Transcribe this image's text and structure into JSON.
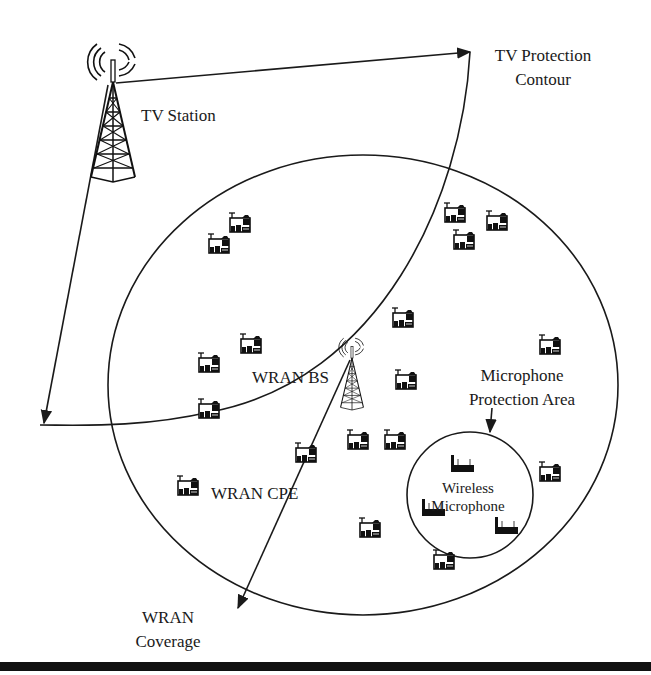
{
  "diagram": {
    "type": "network-coverage-illustration",
    "labels": {
      "tv_station": "TV Station",
      "tv_protection_contour_line1": "TV Protection",
      "tv_protection_contour_line2": "Contour",
      "wran_bs": "WRAN BS",
      "microphone_protection_area_line1": "Microphone",
      "microphone_protection_area_line2": "Protection Area",
      "wireless_microphone_line1": "Wireless",
      "wireless_microphone_line2": "Microphone",
      "wran_cpe": "WRAN CPE",
      "wran_coverage_line1": "WRAN",
      "wran_coverage_line2": "Coverage"
    },
    "nodes": {
      "tv_station": {
        "icon": "broadcast-tower-icon",
        "x": 113,
        "y": 105
      },
      "wran_bs": {
        "icon": "broadcast-tower-icon",
        "x": 352,
        "y": 372
      },
      "wran_cpe_count": 20,
      "wireless_microphone_count": 3
    },
    "colors": {
      "line": "#1a1a1a",
      "background": "#ffffff",
      "bottom_bar": "#111111"
    }
  }
}
